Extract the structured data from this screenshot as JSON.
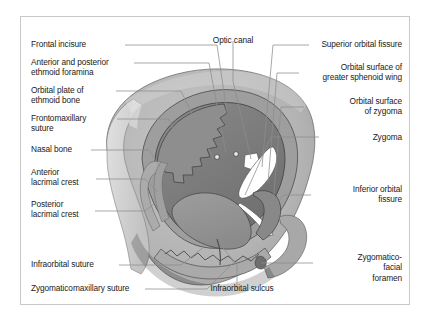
{
  "figure": {
    "border_color": "#c9c9c9",
    "background": "#ffffff"
  },
  "palette": {
    "bone_light": "#bdbdbd",
    "bone_mid": "#9a9a9a",
    "bone_dark": "#7d7d7d",
    "bone_darker": "#6b6b6b",
    "bone_pale": "#d2d2d2",
    "aperture_white": "#ffffff",
    "outline": "#3c3c3c",
    "leader_line": "#8c8c8c",
    "text": "#1a1a1a"
  },
  "labels": {
    "left": [
      {
        "id": "frontal-incisure",
        "text": "Frontal incisure"
      },
      {
        "id": "ethmoid-foramina",
        "text": "Anterior and posterior\nethmoid foramina"
      },
      {
        "id": "orbital-plate-ethmoid",
        "text": "Orbital plate of\nethmoid bone"
      },
      {
        "id": "frontomaxillary-suture",
        "text": "Frontomaxillary\nsuture"
      },
      {
        "id": "nasal-bone",
        "text": "Nasal bone"
      },
      {
        "id": "anterior-lacrimal-crest",
        "text": "Anterior\nlacrimal crest"
      },
      {
        "id": "posterior-lacrimal-crest",
        "text": "Posterior\nlacrimal crest"
      },
      {
        "id": "infraorbital-suture",
        "text": "Infraorbital suture"
      },
      {
        "id": "zygomaticomaxillary-suture",
        "text": "Zygomaticomaxillary suture"
      }
    ],
    "top": [
      {
        "id": "optic-canal",
        "text": "Optic canal"
      }
    ],
    "bottom": [
      {
        "id": "infraorbital-sulcus",
        "text": "Infraorbital sulcus"
      }
    ],
    "right": [
      {
        "id": "superior-orbital-fissure",
        "text": "Superior orbital fissure"
      },
      {
        "id": "orbital-surface-sphenoid",
        "text": "Orbital surface of\ngreater sphenoid wing"
      },
      {
        "id": "orbital-surface-zygoma",
        "text": "Orbital surface\nof zygoma"
      },
      {
        "id": "zygoma",
        "text": "Zygoma"
      },
      {
        "id": "inferior-orbital-fissure",
        "text": "Inferior orbital\nfissure"
      },
      {
        "id": "zygomaticofacial-foramen",
        "text": "Zygomatico-\nfacial\nforamen"
      }
    ]
  }
}
